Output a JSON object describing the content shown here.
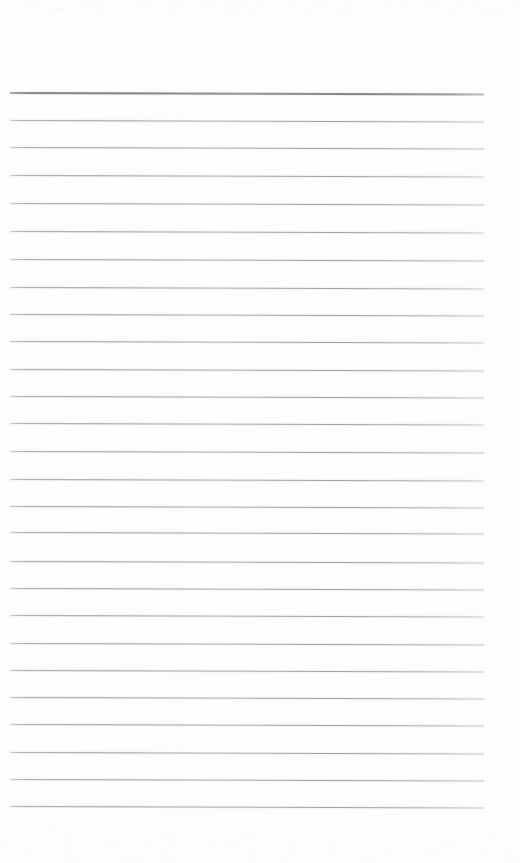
{
  "document": {
    "kind": "scanned-lined-paper",
    "title": "Blank ruled notebook page",
    "page_width": 520,
    "page_height": 863,
    "background_color": "#fdfdfd",
    "has_text": false,
    "has_handwriting": false,
    "has_margin_line": false,
    "has_punch_holes": false
  },
  "ruling": {
    "line_color": "#a6a6aa",
    "header_line_color": "#828287",
    "line_left_x": 10,
    "line_right_x": 484,
    "line_width": 474,
    "line_spacing": 27.4,
    "skew_px": 1.6,
    "top_margin": 92,
    "bottom_margin": 57,
    "header_line_count": 1,
    "body_line_count": 25,
    "total_line_count": 26,
    "header_line_y": 92,
    "body_line_y": [
      120,
      147,
      175,
      203,
      231,
      259,
      287,
      314,
      341,
      369,
      396,
      423,
      451,
      479,
      506,
      532,
      561,
      588,
      615,
      643,
      670,
      697,
      724,
      752,
      779,
      806
    ]
  },
  "artifacts": {
    "top_noise_band": true,
    "bottom_noise_band": true,
    "speckle_opacity": 0.5
  }
}
